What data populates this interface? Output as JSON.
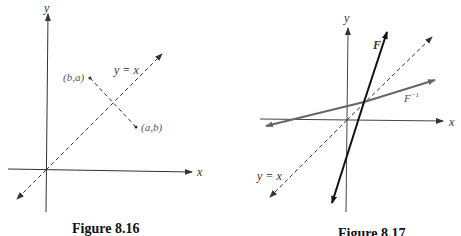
{
  "figures": [
    {
      "caption": "Figure 8.16",
      "axes": {
        "x_label": "x",
        "y_label": "y"
      },
      "line_label": "y = x",
      "point_1_label": "(b,a)",
      "point_2_label": "(a,b)"
    },
    {
      "caption": "Figure 8.17",
      "axes": {
        "x_label": "x",
        "y_label": "y"
      },
      "line_label": "y = x",
      "function_label": "F",
      "inverse_label_base": "F",
      "inverse_label_sup": "−1"
    }
  ],
  "colors": {
    "axis": "#333333",
    "dashed": "#333333",
    "inverse_line": "#666666",
    "function_line": "#111111"
  }
}
